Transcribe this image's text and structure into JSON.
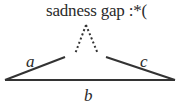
{
  "diagram": {
    "title": "sadness gap :*(",
    "labels": {
      "a": "a",
      "b": "b",
      "c": "c"
    },
    "colors": {
      "line": "#333333",
      "text": "#2a2a2a",
      "background": "#ffffff"
    }
  }
}
